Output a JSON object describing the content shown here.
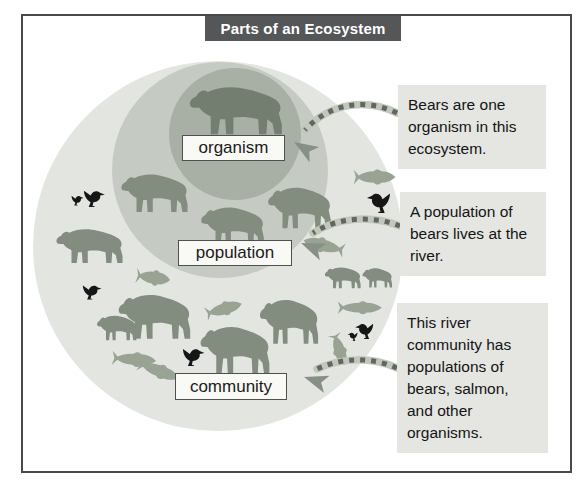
{
  "title_bar": {
    "label": "Parts of an Ecosystem"
  },
  "diagram": {
    "levels": [
      {
        "id": "organism",
        "label": "organism"
      },
      {
        "id": "population",
        "label": "population"
      },
      {
        "id": "community",
        "label": "community"
      }
    ],
    "icons": {
      "bear-icon": "bear silhouette",
      "salmon-icon": "salmon silhouette",
      "bird-icon": "bird silhouette",
      "arrowhead-icon": "arrowhead pointer"
    }
  },
  "callouts": [
    {
      "text": "Bears are one organism in this ecosystem."
    },
    {
      "text": "A population of bears lives at the river."
    },
    {
      "text": "This river community has populations of bears, salmon, and other organisms."
    }
  ],
  "colors": {
    "community_circle": "#e3e6e0",
    "population_circle": "#c5cbc2",
    "organism_circle": "#a8b0a5",
    "bear": "#828d80",
    "organism_bear": "#737e70",
    "salmon": "#98a394",
    "bird": "#161616",
    "title_bar_bg": "#555658",
    "callout_bg": "#e5e6e2",
    "arrow_band": "#c2c7bc",
    "arrow_dash": "#61675e",
    "arrow_head": "#879084",
    "frame_border": "#4a4a4a"
  }
}
